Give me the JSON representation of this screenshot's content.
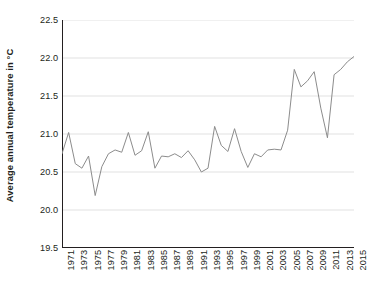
{
  "chart_data": {
    "type": "line",
    "title": "",
    "subtitle": "",
    "xlabel": "",
    "ylabel": "Average annual temperature in °C",
    "xlim": [
      1971,
      2015
    ],
    "ylim": [
      19.5,
      22.5
    ],
    "grid": true,
    "grid_axis": "y",
    "legend": false,
    "legend_position": "none",
    "line_color": "#8c8c8c",
    "axis_color": "#231f20",
    "grid_color": "#d9d9d9",
    "background_color": "#ffffff",
    "y_ticks": [
      "22.5",
      "22.0",
      "21.5",
      "21.0",
      "20.5",
      "20.0",
      "19.5"
    ],
    "y_tick_values": [
      22.5,
      22.0,
      21.5,
      21.0,
      20.5,
      20.0,
      19.5
    ],
    "x_ticks": [
      "1971",
      "1973",
      "1975",
      "1977",
      "1979",
      "1981",
      "1983",
      "1985",
      "1987",
      "1989",
      "1991",
      "1993",
      "1995",
      "1997",
      "1999",
      "2001",
      "2003",
      "2005",
      "2007",
      "2009",
      "2011",
      "2013",
      "2015"
    ],
    "x_tick_values": [
      1971,
      1973,
      1975,
      1977,
      1979,
      1981,
      1983,
      1985,
      1987,
      1989,
      1991,
      1993,
      1995,
      1997,
      1999,
      2001,
      2003,
      2005,
      2007,
      2009,
      2011,
      2013,
      2015
    ],
    "x": [
      1971,
      1972,
      1973,
      1974,
      1975,
      1976,
      1977,
      1978,
      1979,
      1980,
      1981,
      1982,
      1983,
      1984,
      1985,
      1986,
      1987,
      1988,
      1989,
      1990,
      1991,
      1992,
      1993,
      1994,
      1995,
      1996,
      1997,
      1998,
      1999,
      2000,
      2001,
      2002,
      2003,
      2004,
      2005,
      2006,
      2007,
      2008,
      2009,
      2010,
      2011,
      2012,
      2013,
      2014,
      2015
    ],
    "values": [
      20.74,
      21.02,
      20.61,
      20.55,
      20.71,
      20.19,
      20.57,
      20.74,
      20.79,
      20.76,
      21.02,
      20.72,
      20.78,
      21.03,
      20.55,
      20.71,
      20.7,
      20.74,
      20.69,
      20.78,
      20.66,
      20.5,
      20.55,
      21.1,
      20.85,
      20.77,
      21.07,
      20.77,
      20.56,
      20.74,
      20.7,
      20.79,
      20.8,
      20.79,
      21.05,
      21.85,
      21.62,
      21.7,
      21.82,
      21.34,
      20.95,
      21.78,
      21.85,
      21.95,
      22.02
    ],
    "series": [
      {
        "name": "Average annual temperature",
        "values": [
          20.74,
          21.02,
          20.61,
          20.55,
          20.71,
          20.19,
          20.57,
          20.74,
          20.79,
          20.76,
          21.02,
          20.72,
          20.78,
          21.03,
          20.55,
          20.71,
          20.7,
          20.74,
          20.69,
          20.78,
          20.66,
          20.5,
          20.55,
          21.1,
          20.85,
          20.77,
          21.07,
          20.77,
          20.56,
          20.74,
          20.7,
          20.79,
          20.8,
          20.79,
          21.05,
          21.85,
          21.62,
          21.7,
          21.82,
          21.34,
          20.95,
          21.78,
          21.85,
          21.95,
          22.02
        ],
        "color": "#8c8c8c"
      }
    ]
  }
}
